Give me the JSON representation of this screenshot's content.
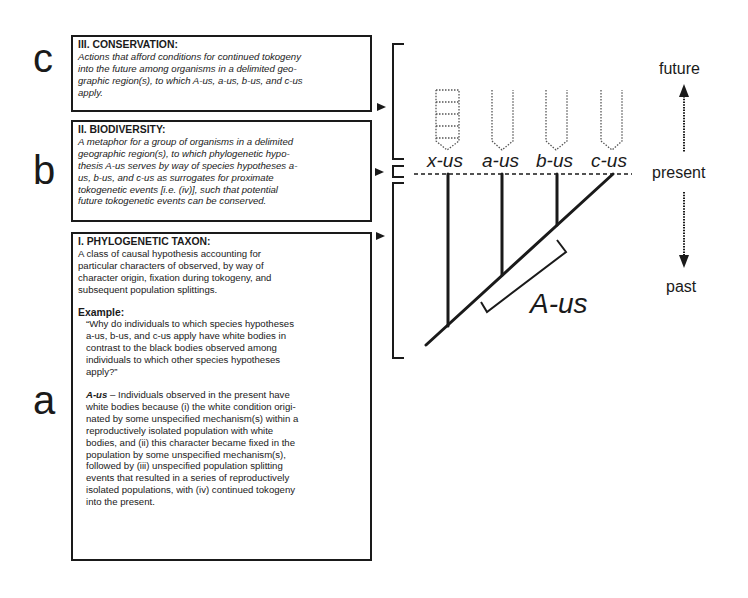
{
  "figure": {
    "panel_letters": {
      "c": "c",
      "b": "b",
      "a": "a"
    },
    "boxes": {
      "conservation": {
        "title": "III. CONSERVATION:",
        "lines": [
          "Actions that afford conditions for continued tokogeny",
          "into the future among organisms in a delimited geo-",
          "graphic region(s), to which A-us, a-us, b-us, and c-us",
          "apply."
        ]
      },
      "biodiversity": {
        "title": "II. BIODIVERSITY:",
        "lines": [
          "A metaphor for a group of organisms in a delimited",
          "geographic region(s), to which phylogenetic hypo-",
          "thesis A-us serves by way of species hypotheses a-",
          "us, b-us, and c-us as surrogates for proximate",
          "tokogenetic events [i.e. (iv)], such that potential",
          "future tokogenetic events can be conserved."
        ]
      },
      "phylogenetic_taxon": {
        "title": "I. PHYLOGENETIC TAXON:",
        "definition_lines": [
          "A class of causal hypothesis accounting for",
          "particular characters of observed, by way of",
          "character origin, fixation during tokogeny, and",
          "subsequent population splittings."
        ],
        "example_title": "Example:",
        "question_lines": [
          "“Why do individuals to which species hypotheses",
          "a-us, b-us, and c-us apply have white bodies in",
          "contrast to the black bodies observed among",
          "individuals to which other species hypotheses",
          "apply?”"
        ],
        "answer_term": "A-us",
        "answer_dash": " – ",
        "answer_lines": [
          "Individuals observed in the present have",
          "white bodies because (i) the white condition origi-",
          "nated by some unspecified mechanism(s) within a",
          "reproductively isolated population with white",
          "bodies, and (ii) this character became fixed in the",
          "population by some unspecified mechanism(s),",
          "followed by (iii) unspecified population splitting",
          "events that resulted in a series of reproductively",
          "isolated populations, with (iv) continued tokogeny",
          "into the present."
        ]
      }
    },
    "tree": {
      "tips": [
        "x-us",
        "a-us",
        "b-us",
        "c-us"
      ],
      "clade_label": "A-us",
      "tip_glyphs": [
        "dotted-arrow-with-rungs",
        "dotted-arrow",
        "dotted-arrow",
        "dotted-arrow"
      ]
    },
    "time_axis": {
      "top": "future",
      "middle": "present",
      "bottom": "past"
    },
    "colors": {
      "ink": "#1a1a1a",
      "dotted": "#555555",
      "background": "#ffffff"
    }
  }
}
